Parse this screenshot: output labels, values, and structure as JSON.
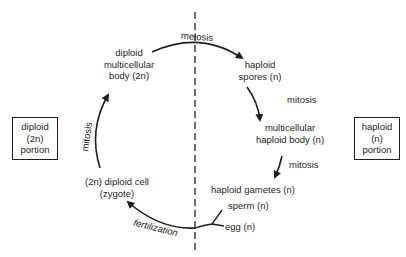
{
  "diagram": {
    "type": "life-cycle",
    "colors": {
      "ink": "#1e1e1e",
      "background": "#ffffff"
    },
    "portions": {
      "diploid": [
        "diploid",
        "(2n)",
        "portion"
      ],
      "haploid": [
        "haploid",
        "(n)",
        "portion"
      ]
    },
    "nodes": {
      "diploid_body": [
        "diploid",
        "multicellular",
        "body (2n)"
      ],
      "haploid_spores": [
        "haploid",
        "spores (n)"
      ],
      "haploid_body": [
        "multicellular",
        "haploid body (n)"
      ],
      "haploid_gametes": "haploid gametes (n)",
      "sperm": "sperm (n)",
      "egg": "egg (n)",
      "zygote": [
        "(2n) diploid cell",
        "(zygote)"
      ]
    },
    "processes": {
      "meiosis": "meiosis",
      "mitosis_spores": "mitosis",
      "mitosis_body": "mitosis",
      "fertilization": "fertilization",
      "mitosis_zygote": "mitosis"
    },
    "divider": "dashed vertical line separating diploid (left) and haploid (right) phases"
  }
}
